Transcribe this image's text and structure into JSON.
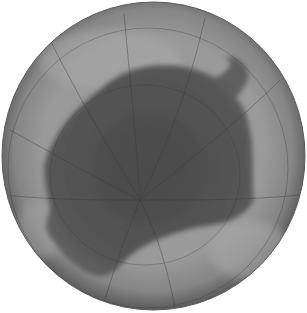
{
  "image": {
    "subject": "polar-view globe with dark hole region",
    "colors": {
      "background": "#ffffff",
      "globe_edge": "#5e5e5e",
      "globe_mid": "#8c8c8c",
      "globe_light": "#a3a3a3",
      "hole_dark": "#4f4f4f",
      "hole_mid": "#585858",
      "grid_line": "#3a3a3a"
    }
  }
}
